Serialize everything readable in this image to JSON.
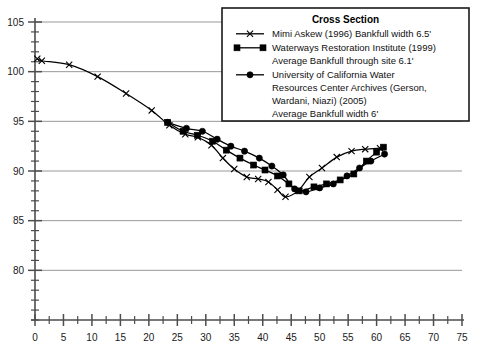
{
  "chart_data": {
    "type": "line",
    "title": "",
    "xlabel": "",
    "ylabel": "",
    "xlim": [
      0,
      75
    ],
    "ylim": [
      75,
      105
    ],
    "xticks": [
      0,
      5,
      10,
      15,
      20,
      25,
      30,
      35,
      40,
      45,
      50,
      55,
      60,
      65,
      70,
      75
    ],
    "yticks": [
      80,
      85,
      90,
      95,
      100,
      105
    ],
    "xtick_labels": [
      "0",
      "5",
      "10",
      "15",
      "20",
      "25",
      "30",
      "35",
      "40",
      "45",
      "50",
      "55",
      "60",
      "65",
      "70",
      "75"
    ],
    "ytick_labels": [
      "80",
      "85",
      "90",
      "95",
      "100",
      "105"
    ],
    "x_minor_step": 2.5,
    "y_minor_step": 1,
    "grid": "horizontal-major",
    "legend_position": "top-right",
    "series": [
      {
        "name": "Mimi Askew (1996) Bankfull width 6.5'",
        "marker": "x",
        "color": "#000000",
        "points": [
          [
            0.4,
            101.3
          ],
          [
            1.2,
            101.1
          ],
          [
            6.0,
            100.7
          ],
          [
            11.0,
            99.5
          ],
          [
            16.0,
            97.8
          ],
          [
            20.5,
            96.1
          ],
          [
            23.6,
            94.6
          ],
          [
            26.4,
            93.7
          ],
          [
            28.6,
            93.4
          ],
          [
            31.0,
            92.6
          ],
          [
            33.0,
            91.3
          ],
          [
            35.0,
            90.2
          ],
          [
            37.2,
            89.4
          ],
          [
            39.2,
            89.2
          ],
          [
            41.0,
            88.9
          ],
          [
            42.6,
            88.1
          ],
          [
            44.0,
            87.4
          ],
          [
            46.2,
            88.0
          ],
          [
            48.2,
            89.4
          ],
          [
            50.4,
            90.3
          ],
          [
            53.0,
            91.4
          ],
          [
            55.6,
            92.0
          ],
          [
            58.0,
            92.2
          ],
          [
            60.6,
            92.3
          ]
        ]
      },
      {
        "name": "Waterways Restoration Institute (1999) Average Bankfull through site 6.1'",
        "marker": "square",
        "color": "#000000",
        "points": [
          [
            23.3,
            94.9
          ],
          [
            26.0,
            94.0
          ],
          [
            28.5,
            93.6
          ],
          [
            31.2,
            93.0
          ],
          [
            33.6,
            92.1
          ],
          [
            36.0,
            91.3
          ],
          [
            38.4,
            90.6
          ],
          [
            40.4,
            90.1
          ],
          [
            42.6,
            89.5
          ],
          [
            44.6,
            88.7
          ],
          [
            46.4,
            88.0
          ],
          [
            49.0,
            88.4
          ],
          [
            51.2,
            88.7
          ],
          [
            53.6,
            89.1
          ],
          [
            56.0,
            89.7
          ],
          [
            58.2,
            91.0
          ],
          [
            60.0,
            91.9
          ],
          [
            61.2,
            92.4
          ]
        ]
      },
      {
        "name": "University of California Water Resources Center Archives (Gerson, Wardani, Niazi) (2005) Average Bankfull width 6'",
        "marker": "circle",
        "color": "#000000",
        "points": [
          [
            23.3,
            94.9
          ],
          [
            26.6,
            94.3
          ],
          [
            29.4,
            94.0
          ],
          [
            32.0,
            93.2
          ],
          [
            34.4,
            92.5
          ],
          [
            36.8,
            92.0
          ],
          [
            39.4,
            91.3
          ],
          [
            41.6,
            90.5
          ],
          [
            43.6,
            89.6
          ],
          [
            45.6,
            88.2
          ],
          [
            47.6,
            87.9
          ],
          [
            50.0,
            88.3
          ],
          [
            52.4,
            88.7
          ],
          [
            54.8,
            89.5
          ],
          [
            57.0,
            90.3
          ],
          [
            59.0,
            91.0
          ],
          [
            61.4,
            91.7
          ]
        ]
      }
    ]
  },
  "legend": {
    "title": "Cross Section",
    "entries": [
      {
        "marker": "x",
        "lines": [
          "Mimi Askew (1996) Bankfull width 6.5'"
        ]
      },
      {
        "marker": "square",
        "lines": [
          "Waterways Restoration Institute (1999)",
          "Average Bankfull through site 6.1'"
        ]
      },
      {
        "marker": "circle",
        "lines": [
          "University of California Water",
          "Resources Center Archives (Gerson,",
          "Wardani, Niazi) (2005)",
          "Average Bankfull width 6'"
        ]
      }
    ]
  },
  "colors": {
    "axis": "#4d4d4d",
    "grid": "#8c8c8c",
    "series": "#000000",
    "legend_border": "#1a1a1a",
    "background": "#ffffff"
  }
}
